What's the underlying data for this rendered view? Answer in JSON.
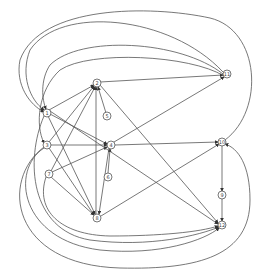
{
  "diagram": {
    "type": "directed-graph",
    "label_note": "node labels are low-resolution; values are best readings",
    "edge_color": "#555555",
    "node_stroke": "#555555",
    "nodes": [
      {
        "id": "n2",
        "label": "2",
        "x": 97,
        "y": 83
      },
      {
        "id": "n1",
        "label": "1",
        "x": 47,
        "y": 113
      },
      {
        "id": "n3",
        "label": "3",
        "x": 47,
        "y": 145
      },
      {
        "id": "n7",
        "label": "7",
        "x": 49,
        "y": 174
      },
      {
        "id": "n5",
        "label": "5",
        "x": 107,
        "y": 116
      },
      {
        "id": "n4",
        "label": "4",
        "x": 111,
        "y": 145
      },
      {
        "id": "n6",
        "label": "6",
        "x": 108,
        "y": 177
      },
      {
        "id": "n8",
        "label": "8",
        "x": 97,
        "y": 218
      },
      {
        "id": "n11",
        "label": "11",
        "x": 227,
        "y": 74
      },
      {
        "id": "n10",
        "label": "10",
        "x": 222,
        "y": 142
      },
      {
        "id": "n9",
        "label": "9",
        "x": 222,
        "y": 195
      },
      {
        "id": "n12",
        "label": "12",
        "x": 222,
        "y": 225
      }
    ],
    "edges": [
      {
        "from": "n2",
        "to": "n11",
        "path": "M100,82 L223,75"
      },
      {
        "from": "n2",
        "to": "n12",
        "path": "M100,85 L218,223"
      },
      {
        "from": "n5",
        "to": "n2",
        "path": "M106,113 L98,87"
      },
      {
        "from": "n1",
        "to": "n2",
        "path": "M49,110 L94,85"
      },
      {
        "from": "n3",
        "to": "n2",
        "path": "M49,142 L94,86"
      },
      {
        "from": "n7",
        "to": "n2",
        "path": "M51,171 L95,87"
      },
      {
        "from": "n8",
        "to": "n2",
        "path": "M96,214 L96,87"
      },
      {
        "from": "n1",
        "to": "n4",
        "path": "M50,114 L107,144"
      },
      {
        "from": "n3",
        "to": "n4",
        "path": "M50,145 L107,145"
      },
      {
        "from": "n7",
        "to": "n4",
        "path": "M52,172 L107,147"
      },
      {
        "from": "n6",
        "to": "n4",
        "path": "M108,173 L110,149"
      },
      {
        "from": "n4",
        "to": "n10",
        "path": "M115,145 L218,142"
      },
      {
        "from": "n4",
        "to": "n11",
        "path": "M114,142 L224,77"
      },
      {
        "from": "n4",
        "to": "n8",
        "path": "M109,148 L99,214"
      },
      {
        "from": "n1",
        "to": "n8",
        "path": "M48,116 L95,214"
      },
      {
        "from": "n3",
        "to": "n8",
        "path": "M49,148 L94,215"
      },
      {
        "from": "n7",
        "to": "n8",
        "path": "M51,177 L94,215"
      },
      {
        "from": "n8",
        "to": "n10",
        "path": "M101,216 L219,144"
      },
      {
        "from": "n10",
        "to": "n9",
        "path": "M222,146 L222,191"
      },
      {
        "from": "n9",
        "to": "n12",
        "path": "M222,199 L222,221"
      },
      {
        "from": "n1",
        "to": "n12",
        "path": "M50,111 L218,224"
      },
      {
        "from": "n11",
        "to": "n1",
        "path": "M223,72 C170,15 60,5 30,50 C20,75 30,100 44,110"
      },
      {
        "from": "n11",
        "to": "n1",
        "path": "M223,74 C180,40 80,35 50,65 C40,80 42,100 46,109"
      },
      {
        "from": "n11",
        "to": "n3",
        "path": "M224,76 C190,55 90,50 60,70 C38,90 35,125 44,143"
      },
      {
        "from": "n10",
        "to": "n1",
        "path": "M225,140 C265,110 260,30 210,18 C150,5 40,5 20,60 C15,85 30,105 44,112"
      },
      {
        "from": "n3",
        "to": "n12",
        "path": "M44,148 C10,170 20,240 100,250 C160,256 205,240 219,228"
      },
      {
        "from": "n1",
        "to": "n12",
        "path": "M44,116 C25,160 30,230 90,240 C150,248 200,235 219,227"
      },
      {
        "from": "n7",
        "to": "n12",
        "path": "M46,177 C35,210 60,235 110,236 C160,236 200,232 218,226"
      },
      {
        "from": "n3",
        "to": "n10",
        "path": "M44,147 C0,180 10,265 120,268 C200,270 250,255 250,200 C250,165 238,148 225,144"
      }
    ]
  }
}
